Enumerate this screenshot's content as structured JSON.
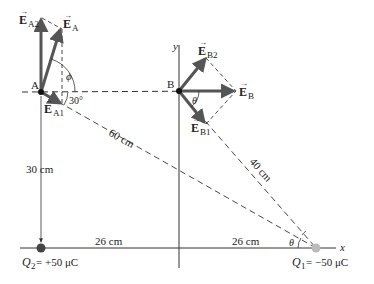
{
  "diagram": {
    "points": {
      "A": {
        "label": "A",
        "x": 41,
        "y": 92
      },
      "B": {
        "label": "B",
        "x": 179,
        "y": 91
      },
      "Q2": {
        "x": 41,
        "y": 248,
        "label_name": "Q",
        "label_sub": "2",
        "label_rest": " = +50 μC"
      },
      "Q1": {
        "x": 316,
        "y": 248,
        "label_name": "Q",
        "label_sub": "1",
        "label_rest": " = −50 μC"
      }
    },
    "axes": {
      "x_label": "x",
      "y_label": "y"
    },
    "vectors": {
      "EA": {
        "letter": "E",
        "sub": "A"
      },
      "EA1": {
        "letter": "E",
        "sub": "A1"
      },
      "EA2": {
        "letter": "E",
        "sub": "A2"
      },
      "EB": {
        "letter": "E",
        "sub": "B"
      },
      "EB1": {
        "letter": "E",
        "sub": "B1"
      },
      "EB2": {
        "letter": "E",
        "sub": "B2"
      }
    },
    "dimensions": {
      "d_A_Q1": "60 cm",
      "d_B_Q1": "40 cm",
      "d_A_Q2": "30 cm",
      "d_Q2_origin": "26 cm",
      "d_origin_Q1": "26 cm"
    },
    "angles": {
      "phi": "ϕ",
      "a30": "30°",
      "theta_B": "θ",
      "theta_Q1": "θ"
    },
    "colors": {
      "ink": "#222222",
      "vector": "#555555",
      "charge_pos": "#444444",
      "charge_neg": "#bbbbbb"
    }
  }
}
